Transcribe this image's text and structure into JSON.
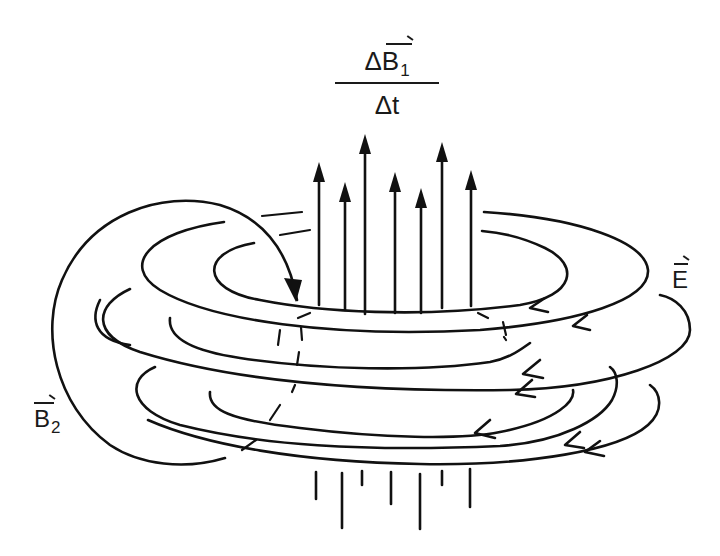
{
  "diagram": {
    "type": "physics-illustration",
    "labels": {
      "rate_numerator_symbol": "ΔB",
      "rate_numerator_subscript": "1",
      "rate_denominator": "Δt",
      "electric_field_symbol": "E",
      "induced_field_symbol": "B",
      "induced_field_subscript": "2"
    },
    "elements": {
      "upward_field_arrows": 7,
      "lower_field_line_stubs": 7,
      "electric_field_loops": 5,
      "loop_arrow_direction": "leftward on front side (counter-clockwise viewed from above)",
      "induced_field_loop": "large curved arrow wrapping from top around left side to bottom"
    },
    "colors": {
      "ink": "#111111",
      "background": "#ffffff"
    }
  }
}
